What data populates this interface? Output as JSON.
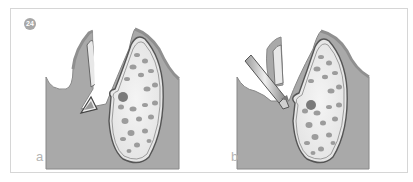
{
  "figure": {
    "number": "24",
    "colors": {
      "tissue": "#a9a9a9",
      "tissue_edge": "#8a8a8a",
      "bone_fill": "#ececec",
      "bone_cells": "#9a9a9a",
      "frame_border": "#d6d6d6",
      "badge": "#a7a7a7"
    },
    "panels": [
      {
        "label": "a",
        "content": "socket with tooth fragment"
      },
      {
        "label": "b",
        "content": "socket with dental instrument"
      }
    ]
  }
}
